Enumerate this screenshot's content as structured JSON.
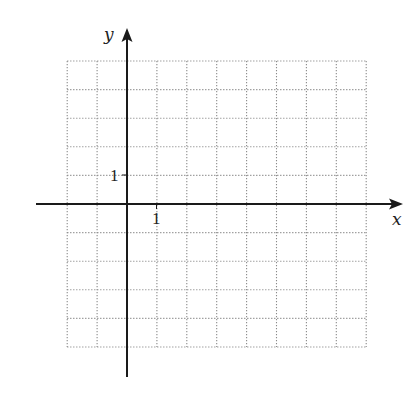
{
  "diagram": {
    "type": "coordinate-grid",
    "x_axis": {
      "label": "x",
      "tick_label": "1",
      "tick_value": 1
    },
    "y_axis": {
      "label": "y",
      "tick_label": "1",
      "tick_value": 1
    },
    "grid": {
      "x_min": -2,
      "x_max": 8,
      "y_min": -5,
      "y_max": 5,
      "step": 1,
      "style": "dotted"
    },
    "colors": {
      "axis": "#1a1a1a",
      "grid": "#8a8a8a",
      "text": "#222222",
      "background": "#ffffff"
    }
  }
}
